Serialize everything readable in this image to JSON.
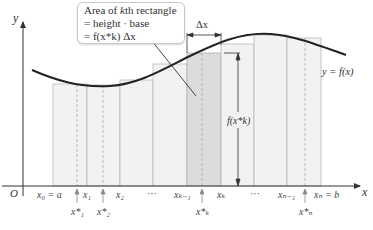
{
  "diagram": {
    "axes": {
      "x_label": "x",
      "y_label": "y",
      "origin_label": "O"
    },
    "curve_label": "y = f(x)",
    "callout": {
      "line1_prefix": "Area of ",
      "line1_k": "k",
      "line1_suffix": "th rectangle",
      "line2": "= height · base",
      "line3": "= f(x*k) Δx"
    },
    "delta_x_label": "Δx",
    "height_label": "f(x*k)",
    "partition_labels": [
      {
        "id": "x0",
        "text": "x₀ = a"
      },
      {
        "id": "x1",
        "text": "x₁"
      },
      {
        "id": "x2",
        "text": "x₂"
      },
      {
        "id": "dots1",
        "text": "···"
      },
      {
        "id": "xk-1",
        "text": "xₖ₋₁"
      },
      {
        "id": "xk",
        "text": "xₖ"
      },
      {
        "id": "dots2",
        "text": "···"
      },
      {
        "id": "xn-1",
        "text": "xₙ₋₁"
      },
      {
        "id": "xn",
        "text": "xₙ = b"
      }
    ],
    "sample_labels": [
      {
        "id": "x1star",
        "text": "x*₁"
      },
      {
        "id": "x2star",
        "text": "x*₂"
      },
      {
        "id": "xkstar",
        "text": "x*ₖ"
      },
      {
        "id": "xnstar",
        "text": "x*ₙ"
      }
    ],
    "highlighted_rectangle": "kth",
    "colors": {
      "curve": "#222222",
      "rect_fill": "#f2f2f2",
      "rect_highlight": "#dcdcdc",
      "rect_stroke": "#b8b8b8",
      "axis": "#333333"
    }
  }
}
